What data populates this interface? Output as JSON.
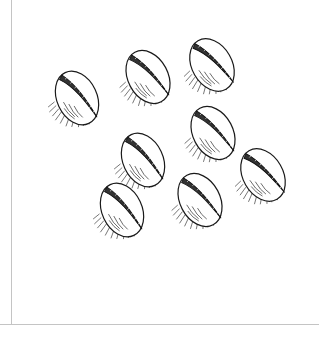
{
  "illustration": {
    "subject": "cowrie shells",
    "style": "black ink line drawing with hatching",
    "shell_count": 8,
    "shells": [
      {
        "cx": 77,
        "cy": 98,
        "rot": -25
      },
      {
        "cx": 148,
        "cy": 77,
        "rot": -28
      },
      {
        "cx": 212,
        "cy": 65,
        "rot": -30
      },
      {
        "cx": 143,
        "cy": 160,
        "rot": -25
      },
      {
        "cx": 213,
        "cy": 133,
        "rot": -28
      },
      {
        "cx": 263,
        "cy": 175,
        "rot": -30
      },
      {
        "cx": 122,
        "cy": 210,
        "rot": -25
      },
      {
        "cx": 200,
        "cy": 200,
        "rot": -28
      }
    ],
    "colors": {
      "ink": "#1a1a1a",
      "border": "#c4c4c4",
      "background": "#ffffff"
    }
  }
}
